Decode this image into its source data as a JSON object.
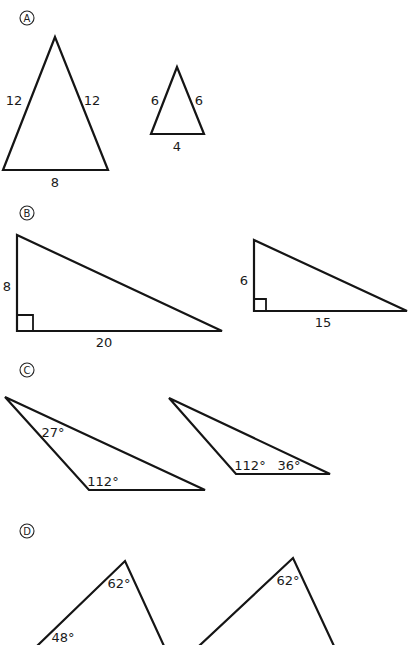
{
  "sections": [
    {
      "marker": "A",
      "shapes": [
        {
          "type": "isosceles-triangle",
          "labels": {
            "left": "12",
            "right": "12",
            "base": "8"
          }
        },
        {
          "type": "isosceles-triangle",
          "labels": {
            "left": "6",
            "right": "6",
            "base": "4"
          }
        }
      ]
    },
    {
      "marker": "B",
      "shapes": [
        {
          "type": "right-triangle",
          "labels": {
            "leg_vertical": "8",
            "leg_horizontal": "20"
          }
        },
        {
          "type": "right-triangle",
          "labels": {
            "leg_vertical": "6",
            "leg_horizontal": "15"
          }
        }
      ]
    },
    {
      "marker": "C",
      "shapes": [
        {
          "type": "obtuse-triangle",
          "labels": {
            "angle_top": "27°",
            "angle_obtuse": "112°"
          }
        },
        {
          "type": "obtuse-triangle",
          "labels": {
            "angle_obtuse": "112°",
            "angle_right": "36°"
          }
        }
      ]
    },
    {
      "marker": "D",
      "shapes": [
        {
          "type": "triangle",
          "labels": {
            "angle_top": "62°",
            "angle_left": "48°"
          }
        },
        {
          "type": "triangle",
          "labels": {
            "angle_top": "62°"
          }
        }
      ]
    }
  ]
}
